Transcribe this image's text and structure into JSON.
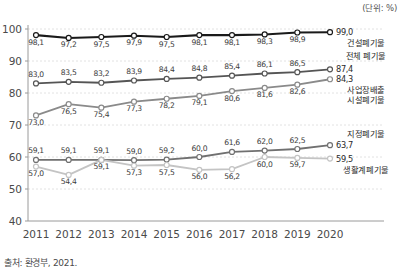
{
  "unit_note": "(단위: %)",
  "source_note": "출처: 환경부, 2021.",
  "axis": {
    "yticks": [
      "40",
      "50",
      "60",
      "70",
      "80",
      "90",
      "100"
    ],
    "xticks": [
      "2011",
      "2012",
      "2013",
      "2014",
      "2015",
      "2016",
      "2017",
      "2018",
      "2019",
      "2020"
    ]
  },
  "legend": {
    "s1_name": "건설폐기물",
    "s1_end": "99,0",
    "s2_name": "전체 폐기물",
    "s2_end": "87,4",
    "s3_name_l1": "사업장배출",
    "s3_name_l2": "시설폐기물",
    "s3_end": "84,3",
    "s4_name": "지정폐기물",
    "s4_end": "63,7",
    "s5_name": "생활계폐기물",
    "s5_end": "59,5"
  },
  "colors": {
    "s1": "#1a1a1a",
    "s2": "#555555",
    "s3": "#8a8a8a",
    "s4": "#707070",
    "s5": "#c4c4c4",
    "grid": "#e2e2e2",
    "axis": "#9a9a9a"
  },
  "chart_data": {
    "type": "line",
    "title": "",
    "subtitle": "",
    "xlabel": "",
    "ylabel": "",
    "unit": "%",
    "grid": true,
    "legend_position": "right-inline",
    "ylim": [
      40,
      100
    ],
    "yticks": [
      40,
      50,
      60,
      70,
      80,
      90,
      100
    ],
    "categories": [
      "2011",
      "2012",
      "2013",
      "2014",
      "2015",
      "2016",
      "2017",
      "2018",
      "2019",
      "2020"
    ],
    "series": [
      {
        "name": "건설폐기물",
        "color": "#1a1a1a",
        "values": [
          98.1,
          97.2,
          97.5,
          97.9,
          97.5,
          98.1,
          98.1,
          98.3,
          98.9,
          99.0
        ],
        "labels": [
          "98,1",
          "97,2",
          "97,5",
          "97,9",
          "97,5",
          "98,1",
          "98,1",
          "98,3",
          "98,9",
          "99,0"
        ],
        "label_pos": [
          "below",
          "below",
          "below",
          "below",
          "below",
          "below",
          "below",
          "below",
          "below",
          "end"
        ]
      },
      {
        "name": "전체 폐기물",
        "color": "#555555",
        "values": [
          83.0,
          83.5,
          83.2,
          83.9,
          84.4,
          84.8,
          85.4,
          86.1,
          86.5,
          87.4
        ],
        "labels": [
          "83,0",
          "83,5",
          "83,2",
          "83,9",
          "84,4",
          "84,8",
          "85,4",
          "86,1",
          "86,5",
          "87,4"
        ],
        "label_pos": [
          "above",
          "above",
          "above",
          "above",
          "above",
          "above",
          "above",
          "above",
          "above",
          "end"
        ]
      },
      {
        "name": "사업장배출시설폐기물",
        "color": "#8a8a8a",
        "values": [
          73.0,
          76.5,
          75.4,
          77.3,
          78.2,
          79.1,
          80.6,
          81.6,
          82.6,
          84.3
        ],
        "labels": [
          "73,0",
          "76,5",
          "75,4",
          "77,3",
          "78,2",
          "79,1",
          "80,6",
          "81,6",
          "82,6",
          "84,3"
        ],
        "label_pos": [
          "below",
          "below",
          "below",
          "below",
          "below",
          "below",
          "below",
          "below",
          "below",
          "end"
        ]
      },
      {
        "name": "지정폐기물",
        "color": "#707070",
        "values": [
          59.1,
          59.1,
          59.1,
          59.0,
          59.2,
          60.0,
          61.6,
          62.0,
          62.5,
          63.7
        ],
        "labels": [
          "59,1",
          "59,1",
          "59,1",
          "59,0",
          "59,2",
          "60,0",
          "61,6",
          "62,0",
          "62,5",
          "63,7"
        ],
        "label_pos": [
          "above",
          "above",
          "above",
          "above",
          "above",
          "above",
          "above",
          "above",
          "above",
          "end"
        ]
      },
      {
        "name": "생활계폐기물",
        "color": "#c4c4c4",
        "values": [
          57.0,
          54.4,
          59.1,
          57.3,
          57.5,
          56.0,
          56.2,
          60.0,
          59.7,
          59.5
        ],
        "labels": [
          "57,0",
          "54,4",
          "59,1",
          "57,3",
          "57,5",
          "56,0",
          "56,2",
          "60,0",
          "59,7",
          "59,5"
        ],
        "label_pos": [
          "below",
          "below",
          "below",
          "below",
          "below",
          "below",
          "below",
          "below",
          "below",
          "end"
        ]
      }
    ]
  }
}
